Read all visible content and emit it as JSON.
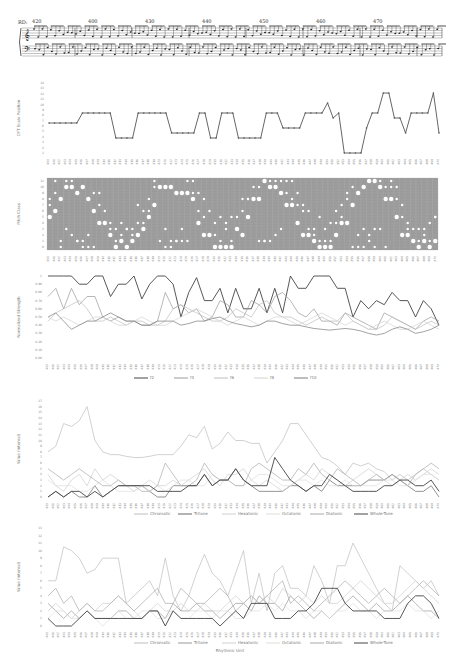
{
  "score": {
    "system_label": "RD:",
    "measure_numbers": [
      "420",
      "400",
      "430",
      "440",
      "450",
      "460",
      "470"
    ]
  },
  "chart_data": [
    {
      "type": "line",
      "title": "",
      "ylabel": "DFT Scale Position",
      "xlabel": "",
      "yticks": [
        "1",
        "2",
        "3",
        "4",
        "5",
        "6",
        "7",
        "8",
        "9",
        "10",
        "11",
        "12",
        "13",
        "14"
      ],
      "ylim": [
        0,
        14
      ],
      "series": [
        {
          "name": "scale position",
          "color": "#555555",
          "values": [
            6,
            6,
            6,
            6,
            6,
            6,
            8,
            8,
            8,
            8,
            8,
            8,
            3,
            3,
            3,
            3,
            8,
            8,
            8,
            8,
            8,
            8,
            4,
            4,
            4,
            4,
            4,
            8,
            8,
            3,
            3,
            8,
            8,
            8,
            3,
            3,
            3,
            3,
            3,
            8,
            8,
            8,
            5,
            5,
            5,
            5,
            8,
            8,
            8,
            8,
            10,
            7,
            8,
            0,
            0,
            0,
            0,
            5,
            8,
            8,
            12,
            12,
            7,
            7,
            4,
            8,
            8,
            8,
            8,
            12,
            4
          ]
        }
      ]
    },
    {
      "type": "heatmap",
      "title": "",
      "ylabel": "Pitch Class",
      "xlabel": "",
      "yticks": [
        "0",
        "1",
        "2",
        "3",
        "4",
        "5",
        "6",
        "7",
        "8",
        "9",
        "10",
        "11"
      ],
      "note": "white dots of varying sizes on grey grid indicate pitch-class presence per measure"
    },
    {
      "type": "line",
      "title": "",
      "ylabel": "Normalized Strength",
      "xlabel": "",
      "yticks": [
        "0.00",
        "0.10",
        "0.20",
        "0.30",
        "0.40",
        "0.50",
        "0.60",
        "0.70",
        "0.80",
        "0.90",
        "1"
      ],
      "ylim": [
        0,
        1
      ],
      "legend": [
        "f2",
        "f4",
        "f6",
        "f8",
        "f10"
      ],
      "series": [
        {
          "name": "f2",
          "color": "#444444",
          "values": [
            1,
            1,
            1,
            1,
            0.9,
            0.9,
            1,
            1,
            0.75,
            0.9,
            0.9,
            1,
            0.72,
            0.9,
            1,
            1,
            0.9,
            0.5,
            0.8,
            0.98,
            0.7,
            0.7,
            0.85,
            0.55,
            0.85,
            0.6,
            0.6,
            0.85,
            0.55,
            0.85,
            0.55,
            1,
            0.85,
            0.85,
            1,
            1,
            1,
            0.85,
            0.85,
            0.5,
            0.7,
            0.6,
            0.7,
            0.65,
            0.8,
            0.7,
            0.7,
            0.5,
            0.7,
            0.6,
            0.4
          ]
        },
        {
          "name": "f4",
          "color": "#9a9a9a",
          "values": [
            0.75,
            0.85,
            0.6,
            0.85,
            0.65,
            0.75,
            0.75,
            0.5,
            0.45,
            0.5,
            0.45,
            0.45,
            0.4,
            0.4,
            0.45,
            0.8,
            0.6,
            0.65,
            0.55,
            0.6,
            0.45,
            0.5,
            0.7,
            0.65,
            0.5,
            0.5,
            0.7,
            0.65,
            0.55,
            0.75,
            0.8,
            0.7,
            0.55,
            0.5,
            0.6,
            0.45,
            0.45,
            0.4,
            0.55,
            0.5,
            0.45,
            0.4,
            0.35,
            0.55,
            0.5,
            0.45,
            0.4,
            0.35,
            0.45,
            0.5,
            0.45
          ]
        },
        {
          "name": "f6",
          "color": "#bdbdbd",
          "values": [
            0.45,
            0.55,
            0.6,
            0.65,
            0.7,
            0.6,
            0.45,
            0.45,
            0.5,
            0.45,
            0.4,
            0.45,
            0.45,
            0.4,
            0.4,
            0.45,
            0.6,
            0.65,
            0.6,
            0.55,
            0.5,
            0.45,
            0.45,
            0.5,
            0.6,
            0.55,
            0.5,
            0.65,
            0.7,
            0.55,
            0.5,
            0.5,
            0.45,
            0.4,
            0.45,
            0.5,
            0.45,
            0.45,
            0.55,
            0.45,
            0.4,
            0.35,
            0.35,
            0.4,
            0.5,
            0.45,
            0.4,
            0.35,
            0.4,
            0.45,
            0.4
          ]
        },
        {
          "name": "f8",
          "color": "#d2d2d2",
          "values": [
            0.5,
            0.45,
            0.5,
            0.45,
            0.4,
            0.45,
            0.5,
            0.5,
            0.45,
            0.4,
            0.4,
            0.45,
            0.5,
            0.45,
            0.4,
            0.4,
            0.45,
            0.5,
            0.55,
            0.6,
            0.55,
            0.5,
            0.45,
            0.4,
            0.45,
            0.5,
            0.45,
            0.4,
            0.45,
            0.5,
            0.5,
            0.45,
            0.4,
            0.45,
            0.5,
            0.55,
            0.5,
            0.45,
            0.4,
            0.45,
            0.4,
            0.35,
            0.4,
            0.45,
            0.4,
            0.35,
            0.35,
            0.4,
            0.45,
            0.4,
            0.35
          ]
        },
        {
          "name": "f10",
          "color": "#7a7a7a",
          "values": [
            0.5,
            0.55,
            0.45,
            0.35,
            0.4,
            0.45,
            0.45,
            0.5,
            0.55,
            0.5,
            0.45,
            0.45,
            0.4,
            0.4,
            0.45,
            0.45,
            0.45,
            0.4,
            0.42,
            0.45,
            0.45,
            0.48,
            0.5,
            0.45,
            0.42,
            0.4,
            0.38,
            0.4,
            0.45,
            0.45,
            0.42,
            0.4,
            0.4,
            0.38,
            0.36,
            0.35,
            0.34,
            0.35,
            0.36,
            0.35,
            0.33,
            0.3,
            0.28,
            0.3,
            0.35,
            0.38,
            0.35,
            0.3,
            0.32,
            0.35,
            0.4
          ]
        }
      ]
    },
    {
      "type": "line",
      "title": "",
      "ylabel": "Value (Interval)",
      "xlabel": "",
      "yticks": [
        "0",
        "1",
        "2",
        "3",
        "4",
        "5",
        "6",
        "7",
        "8",
        "9",
        "10",
        "11",
        "12",
        "13",
        "14",
        "15",
        "16",
        "17"
      ],
      "ylim": [
        0,
        17
      ],
      "legend": [
        "Chromatic",
        "Tritone",
        "Hexatonic",
        "Octatonic",
        "Diatonic",
        "Whole-Tone"
      ],
      "series": [
        {
          "name": "Chromatic",
          "color": "#bdbdbd",
          "values": [
            8,
            9,
            13,
            12.5,
            13.5,
            16,
            10,
            8,
            7.5,
            7.5,
            7.2,
            7,
            7,
            7.2,
            7.5,
            7.5,
            7.5,
            9,
            11,
            10.5,
            12.5,
            8.5,
            9.5,
            11.5,
            10,
            10,
            9.5,
            9.5,
            6,
            8,
            10,
            13,
            13,
            11,
            9,
            7,
            6.5,
            5.5,
            4,
            6,
            5.5,
            6,
            5,
            4.5,
            3,
            4,
            3,
            4,
            5,
            4,
            3
          ]
        },
        {
          "name": "Tritone",
          "color": "#666666",
          "values": [
            0,
            1,
            0,
            1,
            0,
            0,
            2,
            0,
            1,
            2,
            2,
            2,
            2,
            1,
            0,
            0,
            2,
            2,
            2,
            2,
            4,
            2,
            3,
            3,
            5,
            3,
            2,
            1,
            1,
            1,
            1,
            2,
            2,
            1,
            2,
            1,
            3,
            2,
            2,
            2,
            2,
            3,
            3,
            3,
            4,
            3,
            2,
            1,
            1,
            2,
            0
          ]
        },
        {
          "name": "Hexatonic",
          "color": "#cfcfcf",
          "values": [
            4,
            2,
            1,
            3,
            4,
            2,
            5,
            3,
            4,
            3,
            2,
            1,
            2,
            3,
            2,
            2,
            3,
            2,
            3,
            4,
            5,
            3,
            2,
            4,
            4,
            5,
            3,
            2,
            3,
            2,
            1,
            2,
            3,
            4,
            3,
            5,
            4,
            3,
            2,
            3,
            4,
            5,
            4,
            3,
            2,
            3,
            4,
            3,
            4,
            5,
            4
          ]
        },
        {
          "name": "Octatonic",
          "color": "#dddddd",
          "values": [
            3,
            2,
            2,
            2,
            1,
            1,
            2,
            3,
            2,
            1,
            1,
            1,
            2,
            1,
            2,
            1,
            2,
            3,
            3,
            2,
            2,
            4,
            3,
            3,
            2,
            2,
            3,
            4,
            4,
            3,
            2,
            2,
            3,
            3,
            2,
            3,
            2,
            2,
            3,
            2,
            2,
            2,
            2,
            3,
            3,
            2,
            2,
            3,
            4,
            4,
            3
          ]
        },
        {
          "name": "Diatonic",
          "color": "#aaaaaa",
          "values": [
            5,
            4,
            3,
            4,
            5,
            4,
            3,
            2,
            2,
            3,
            2,
            2,
            1,
            1,
            2,
            6,
            4,
            2,
            2,
            3,
            6,
            4,
            3,
            3,
            2,
            2,
            5,
            6,
            5,
            4,
            3,
            3,
            5,
            4,
            6,
            4,
            3,
            5,
            4,
            3,
            2,
            3,
            4,
            3,
            4,
            3,
            2,
            4,
            5,
            6,
            5
          ]
        },
        {
          "name": "Whole-Tone",
          "color": "#444444",
          "values": [
            0,
            1,
            0,
            1,
            1,
            0,
            1,
            0,
            1,
            2,
            2,
            2,
            2,
            2,
            1,
            1,
            1,
            1,
            2,
            2,
            4,
            2,
            3,
            3,
            5,
            3,
            2,
            2,
            2,
            7,
            5,
            3,
            2,
            1,
            2,
            2,
            4,
            3,
            2,
            1,
            1,
            1,
            1,
            2,
            2,
            3,
            3,
            2,
            2,
            3,
            1
          ]
        }
      ]
    },
    {
      "type": "line",
      "title": "",
      "ylabel": "Value (Interval)",
      "xlabel": "Rhythmic Unit",
      "yticks": [
        "0",
        "1",
        "2",
        "3",
        "4",
        "5",
        "6",
        "7",
        "8",
        "9",
        "10",
        "11",
        "12",
        "13"
      ],
      "ylim": [
        0,
        13
      ],
      "legend": [
        "Chromatic",
        "Tritone",
        "Hexatonic",
        "Octatonic",
        "Diatonic",
        "Whole-Tone"
      ],
      "series": [
        {
          "name": "Chromatic",
          "color": "#bdbdbd",
          "values": [
            6,
            6,
            10.5,
            10,
            9,
            7,
            7.5,
            9,
            9,
            9,
            3,
            4,
            5,
            6,
            4,
            9,
            4,
            2,
            4,
            7,
            9.5,
            7,
            6,
            4,
            7,
            10,
            3,
            7,
            2,
            7,
            8,
            5,
            5,
            4,
            8,
            6,
            3,
            8,
            8,
            11,
            9,
            7,
            5,
            3,
            2,
            8,
            7,
            6,
            5,
            6,
            4
          ]
        },
        {
          "name": "Tritone",
          "color": "#999999",
          "values": [
            3,
            2,
            1,
            2,
            1,
            2,
            1,
            1,
            1,
            2,
            2,
            1,
            1,
            2,
            2,
            1,
            3,
            2,
            2,
            3,
            2,
            2,
            1,
            2,
            3,
            3,
            2,
            4,
            3,
            3,
            2,
            4,
            3,
            2,
            1,
            2,
            1,
            2,
            3,
            4,
            3,
            2,
            3,
            2,
            2,
            3,
            4,
            3,
            2,
            2,
            1
          ]
        },
        {
          "name": "Hexatonic",
          "color": "#cfcfcf",
          "values": [
            2,
            3,
            2,
            1,
            2,
            3,
            2,
            3,
            3,
            4,
            3,
            2,
            1,
            2,
            3,
            2,
            2,
            3,
            2,
            2,
            3,
            2,
            2,
            3,
            4,
            3,
            4,
            3,
            4,
            3,
            5,
            4,
            3,
            4,
            3,
            4,
            3,
            3,
            4,
            5,
            6,
            5,
            4,
            3,
            3,
            4,
            5,
            6,
            5,
            4,
            3
          ]
        },
        {
          "name": "Octatonic",
          "color": "#dddddd",
          "values": [
            1,
            2,
            2,
            1,
            1,
            2,
            1,
            0,
            1,
            2,
            1,
            1,
            2,
            2,
            1,
            1,
            2,
            1,
            1,
            2,
            2,
            1,
            2,
            2,
            1,
            1,
            2,
            2,
            3,
            2,
            3,
            2,
            2,
            1,
            2,
            2,
            1,
            2,
            2,
            3,
            2,
            2,
            1,
            2,
            2,
            2,
            3,
            2,
            2,
            1,
            2
          ]
        },
        {
          "name": "Diatonic",
          "color": "#aaaaaa",
          "values": [
            4,
            5,
            3,
            4,
            2,
            3,
            2,
            2,
            3,
            4,
            3,
            2,
            3,
            4,
            5,
            3,
            3,
            5,
            4,
            3,
            3,
            4,
            5,
            4,
            2,
            3,
            4,
            3,
            4,
            5,
            6,
            3,
            4,
            3,
            2,
            3,
            4,
            5,
            6,
            5,
            4,
            3,
            4,
            5,
            4,
            3,
            4,
            5,
            6,
            5,
            4
          ]
        },
        {
          "name": "Whole-Tone",
          "color": "#444444",
          "values": [
            1,
            0,
            0,
            0,
            1,
            2,
            1,
            1,
            1,
            1,
            1,
            1,
            1,
            2,
            2,
            0,
            2,
            1,
            1,
            1,
            1,
            1,
            0,
            1,
            2,
            1,
            3,
            3,
            3,
            1,
            1,
            1,
            2,
            2,
            3,
            5,
            5,
            5,
            3,
            2,
            2,
            2,
            2,
            1,
            1,
            1,
            3,
            4,
            4,
            3,
            1
          ]
        }
      ]
    }
  ]
}
